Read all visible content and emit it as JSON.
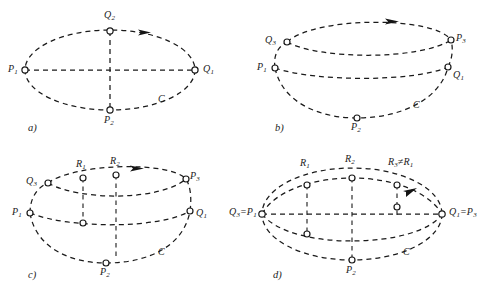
{
  "figure": {
    "title": "",
    "background_color": "#ffffff",
    "ink_color": "#1a1a1a",
    "line_style": "dashed"
  },
  "panels": [
    {
      "tag": "a)",
      "curve_label": "C",
      "description": "Single ellipse with horizontal and vertical dashed axes",
      "points": [
        {
          "id": "Q2",
          "label": "Q",
          "sub": "2",
          "position": "top"
        },
        {
          "id": "P1",
          "label": "P",
          "sub": "1",
          "position": "left"
        },
        {
          "id": "Q1",
          "label": "Q",
          "sub": "1",
          "position": "right"
        },
        {
          "id": "P2",
          "label": "P",
          "sub": "2",
          "position": "bottom"
        }
      ],
      "arrows": 1
    },
    {
      "tag": "b)",
      "curve_label": "C",
      "description": "Lens-shaped double arc with lower ellipse",
      "points": [
        {
          "id": "Q3",
          "label": "Q",
          "sub": "3",
          "position": "upper-left"
        },
        {
          "id": "P3",
          "label": "P",
          "sub": "3",
          "position": "upper-right"
        },
        {
          "id": "P1",
          "label": "P",
          "sub": "1",
          "position": "left"
        },
        {
          "id": "Q1",
          "label": "Q",
          "sub": "1",
          "position": "right"
        },
        {
          "id": "P2",
          "label": "P",
          "sub": "2",
          "position": "bottom"
        }
      ],
      "arrows": 1
    },
    {
      "tag": "c)",
      "curve_label": "C",
      "description": "Lens with two vertical chords through R1 and R2",
      "points": [
        {
          "id": "R1",
          "label": "R",
          "sub": "1",
          "position": "top-left-inner"
        },
        {
          "id": "R2",
          "label": "R",
          "sub": "2",
          "position": "top-center"
        },
        {
          "id": "Q3",
          "label": "Q",
          "sub": "3",
          "position": "upper-left"
        },
        {
          "id": "P3",
          "label": "P",
          "sub": "3",
          "position": "upper-right"
        },
        {
          "id": "P1",
          "label": "P",
          "sub": "1",
          "position": "left"
        },
        {
          "id": "Q1",
          "label": "Q",
          "sub": "1",
          "position": "right"
        },
        {
          "id": "P2",
          "label": "P",
          "sub": "2",
          "position": "bottom"
        }
      ],
      "arrows": 1
    },
    {
      "tag": "d)",
      "curve_label": "C",
      "description": "Ellipse with three vertical chords and coincident endpoints",
      "points": [
        {
          "id": "R1",
          "label": "R",
          "sub": "1",
          "position": "top-left-inner"
        },
        {
          "id": "R2",
          "label": "R",
          "sub": "2",
          "position": "top-center"
        },
        {
          "id": "R3neR1",
          "label": "R₃≠R₁",
          "sub": "",
          "position": "top-right-inner"
        },
        {
          "id": "Q3eqP1",
          "label": "Q₃=P₁",
          "sub": "",
          "position": "left"
        },
        {
          "id": "Q1eqP3",
          "label": "Q₁=P₃",
          "sub": "",
          "position": "right"
        },
        {
          "id": "P2",
          "label": "P",
          "sub": "2",
          "position": "bottom"
        }
      ],
      "arrows": 1
    }
  ],
  "labels": {
    "a": {
      "tag": "a)",
      "curve": "C",
      "Q2": "Q",
      "Q2s": "2",
      "P1": "P",
      "P1s": "1",
      "Q1": "Q",
      "Q1s": "1",
      "P2": "P",
      "P2s": "2"
    },
    "b": {
      "tag": "b)",
      "curve": "C",
      "Q3": "Q",
      "Q3s": "3",
      "P3": "P",
      "P3s": "3",
      "P1": "P",
      "P1s": "1",
      "Q1": "Q",
      "Q1s": "1",
      "P2": "P",
      "P2s": "2"
    },
    "c": {
      "tag": "c)",
      "curve": "C",
      "R1": "R",
      "R1s": "1",
      "R2": "R",
      "R2s": "2",
      "Q3": "Q",
      "Q3s": "3",
      "P3": "P",
      "P3s": "3",
      "P1": "P",
      "P1s": "1",
      "Q1": "Q",
      "Q1s": "1",
      "P2": "P",
      "P2s": "2"
    },
    "d": {
      "tag": "d)",
      "curve": "C",
      "R1": "R",
      "R1s": "1",
      "R2": "R",
      "R2s": "2",
      "R3": "R",
      "R3s": "3",
      "R3rel": "≠R",
      "R3rels": "1",
      "Q3P1a": "Q",
      "Q3P1as": "3",
      "Q3P1b": "=P",
      "Q3P1bs": "1",
      "Q1P3a": "Q",
      "Q1P3as": "1",
      "Q1P3b": "=P",
      "Q1P3bs": "3",
      "P2": "P",
      "P2s": "2"
    }
  }
}
